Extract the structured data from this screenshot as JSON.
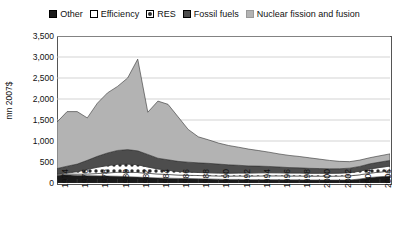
{
  "chart_data": {
    "type": "area",
    "stacked": true,
    "title": "",
    "subtitle": "",
    "xlabel": "",
    "ylabel": "mn 2007$",
    "ylim": [
      0,
      3500
    ],
    "xlim": [
      1974,
      2007
    ],
    "grid": true,
    "grid_axis": "y",
    "legend_position": "top",
    "ytick_labels": [
      "3,500",
      "3,000",
      "2,500",
      "2,000",
      "1,500",
      "1,000",
      "500",
      "0"
    ],
    "ytick_values": [
      3500,
      3000,
      2500,
      2000,
      1500,
      1000,
      500,
      0
    ],
    "xtick_labels": [
      "1974",
      "1976",
      "1978",
      "1980",
      "1982",
      "1984",
      "1986",
      "1988",
      "1990",
      "1992",
      "1994",
      "1996",
      "1998",
      "2000",
      "2002",
      "2004",
      "2006"
    ],
    "x": [
      1974,
      1975,
      1976,
      1977,
      1978,
      1979,
      1980,
      1981,
      1982,
      1983,
      1984,
      1985,
      1986,
      1987,
      1988,
      1989,
      1990,
      1991,
      1992,
      1993,
      1994,
      1995,
      1996,
      1997,
      1998,
      1999,
      2000,
      2001,
      2002,
      2003,
      2004,
      2005,
      2006,
      2007
    ],
    "series": [
      {
        "name": "Other",
        "fill": "#1a1a1a",
        "pattern": "solid-black",
        "values": [
          185,
          195,
          180,
          175,
          170,
          165,
          160,
          150,
          140,
          130,
          120,
          115,
          110,
          105,
          100,
          95,
          90,
          85,
          85,
          80,
          80,
          80,
          78,
          75,
          75,
          72,
          72,
          70,
          70,
          72,
          95,
          130,
          150,
          165
        ]
      },
      {
        "name": "Efficiency",
        "fill": "#ffffff",
        "pattern": "solid-white",
        "values": [
          20,
          25,
          30,
          40,
          55,
          75,
          95,
          105,
          110,
          100,
          95,
          88,
          80,
          78,
          78,
          78,
          78,
          80,
          82,
          85,
          88,
          90,
          92,
          92,
          92,
          92,
          92,
          92,
          95,
          98,
          100,
          105,
          110,
          118
        ]
      },
      {
        "name": "RES",
        "fill": "#ffffff",
        "pattern": "dotted",
        "values": [
          10,
          25,
          60,
          110,
          150,
          175,
          190,
          195,
          185,
          150,
          120,
          100,
          85,
          78,
          72,
          70,
          68,
          68,
          70,
          72,
          74,
          74,
          72,
          70,
          70,
          68,
          68,
          68,
          70,
          75,
          85,
          100,
          110,
          120
        ]
      },
      {
        "name": "Fossil fuels",
        "fill": "#4d4d4d",
        "pattern": "solid-darkgray",
        "values": [
          130,
          155,
          180,
          215,
          260,
          300,
          330,
          345,
          330,
          300,
          255,
          250,
          240,
          235,
          230,
          225,
          215,
          200,
          185,
          170,
          160,
          150,
          140,
          130,
          125,
          118,
          112,
          108,
          105,
          108,
          115,
          122,
          128,
          135
        ]
      },
      {
        "name": "Nuclear fission and fusion",
        "fill": "#b3b3b3",
        "pattern": "solid-lightgray",
        "values": [
          1105,
          1300,
          1250,
          1010,
          1265,
          1430,
          1525,
          1705,
          2185,
          1005,
          1360,
          1320,
          1060,
          780,
          620,
          560,
          500,
          460,
          430,
          400,
          370,
          340,
          310,
          290,
          270,
          250,
          225,
          200,
          175,
          155,
          150,
          145,
          150,
          155
        ]
      }
    ],
    "totals": [
      1450,
      1700,
      1700,
      1550,
      1900,
      2145,
      2300,
      2500,
      2950,
      1685,
      1950,
      1873,
      1575,
      1276,
      1100,
      1028,
      951,
      893,
      852,
      807,
      772,
      734,
      692,
      657,
      632,
      600,
      569,
      538,
      515,
      508,
      545,
      602,
      648,
      693
    ]
  },
  "legend": {
    "items": [
      {
        "label": "Other",
        "swatch": "solid-black"
      },
      {
        "label": "Efficiency",
        "swatch": "solid-white"
      },
      {
        "label": "RES",
        "swatch": "dotted"
      },
      {
        "label": "Fossil fuels",
        "swatch": "solid-darkgray"
      },
      {
        "label": "Nuclear fission and fusion",
        "swatch": "solid-lightgray"
      }
    ]
  },
  "axes": {
    "y_title": "mn 2007$"
  },
  "colors": {
    "other": "#1a1a1a",
    "efficiency": "#ffffff",
    "res": "#ffffff",
    "fossil_fuels": "#4d4d4d",
    "nuclear": "#b3b3b3",
    "gridline": "#c8c8c8",
    "axis": "#555555",
    "text": "#111111"
  }
}
